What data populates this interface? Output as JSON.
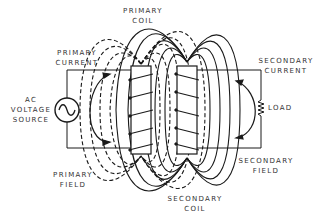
{
  "labels": {
    "primary_coil": [
      "PRIMARY",
      "COIL"
    ],
    "primary_current": [
      "PRIMARY",
      "CURRENT"
    ],
    "ac_source": [
      "AC",
      "VOLTAGE",
      "SOURCE"
    ],
    "primary_field": [
      "PRIMARY",
      "FIELD"
    ],
    "secondary_current": [
      "SECONDARY",
      "CURRENT"
    ],
    "load": [
      "LOAD"
    ],
    "secondary_field": [
      "SECONDARY",
      "FIELD"
    ],
    "secondary_coil": [
      "SECONDARY",
      "COIL"
    ]
  },
  "colors": {
    "line": "#1a1a1a",
    "text": "#333333",
    "background": "#ffffff"
  },
  "styles": {
    "primary_field_lines": "dashed",
    "secondary_field_lines": "solid"
  },
  "icons": {
    "ac_source": "sine-wave-in-circle",
    "load": "resistor-zigzag"
  }
}
